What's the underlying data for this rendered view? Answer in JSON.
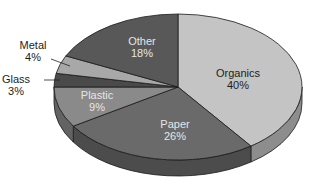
{
  "chart_data": {
    "type": "pie",
    "style": "3d-exploded-none",
    "title": "",
    "categories": [
      "Organics",
      "Paper",
      "Plastic",
      "Glass",
      "Metal",
      "Other"
    ],
    "values": [
      40,
      26,
      9,
      3,
      4,
      18
    ],
    "unit": "%",
    "start_angle": "12 o'clock",
    "direction": "clockwise",
    "colors": {
      "Organics": "#c4c4c4",
      "Paper": "#6a6a6a",
      "Plastic": "#8a8a8a",
      "Glass": "#4a4a4a",
      "Metal": "#a8a8a8",
      "Other": "#585858"
    },
    "labels": [
      {
        "name": "Organics",
        "pct": "40%",
        "position": "inside"
      },
      {
        "name": "Paper",
        "pct": "26%",
        "position": "inside"
      },
      {
        "name": "Plastic",
        "pct": "9%",
        "position": "inside"
      },
      {
        "name": "Glass",
        "pct": "3%",
        "position": "outside-leader"
      },
      {
        "name": "Metal",
        "pct": "4%",
        "position": "outside-leader"
      },
      {
        "name": "Other",
        "pct": "18%",
        "position": "inside"
      }
    ],
    "legend": "none"
  }
}
